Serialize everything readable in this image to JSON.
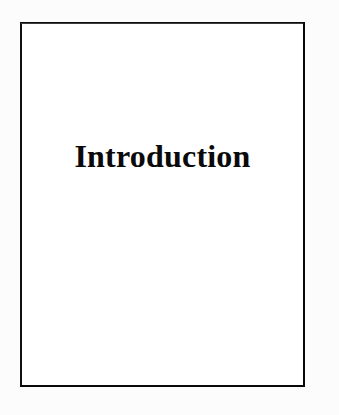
{
  "document": {
    "type": "scanned-book-page",
    "page_kind": "section-divider",
    "background_color": "#fcfcfc",
    "paper_color": "#ffffff"
  },
  "frame": {
    "name": "page-border-rectangle",
    "border_color": "#0d0d0d",
    "border_width_px": 2,
    "left_px": 20,
    "top_px": 22,
    "width_px": 285,
    "height_px": 365
  },
  "content": {
    "title": "Introduction",
    "title_color": "#0a0a0a",
    "title_font_size_px": 32,
    "title_weight": "bold",
    "title_align": "center",
    "body_text": "",
    "blank_above_title": "",
    "blank_below_title": ""
  }
}
